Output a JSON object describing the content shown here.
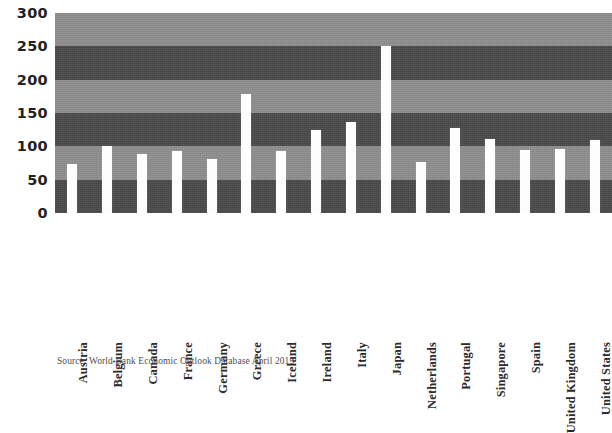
{
  "chart_data": {
    "type": "bar",
    "title": "",
    "subtitle": "",
    "xlabel": "",
    "ylabel": "",
    "ylim": [
      0,
      300
    ],
    "ytick_step": 50,
    "ytick_labels": [
      "300",
      "250",
      "200",
      "150",
      "100",
      "50",
      "0"
    ],
    "ytick_values": [
      300,
      250,
      200,
      150,
      100,
      50,
      0
    ],
    "grid": false,
    "banded_background": true,
    "band_colors": {
      "light": "#8f8f8f",
      "dark": "#4a4a4a"
    },
    "bar_color": "#fdfdfd",
    "legend": [],
    "legend_position": "none",
    "categories": [
      "Austria",
      "Belgium",
      "Canada",
      "France",
      "Germany",
      "Greece",
      "Iceland",
      "Ireland",
      "Italy",
      "Japan",
      "Netherlands",
      "Portugal",
      "Singapore",
      "Spain",
      "United Kingdom",
      "United States"
    ],
    "values": [
      74,
      101,
      88,
      93,
      81,
      179,
      93,
      125,
      136,
      250,
      77,
      128,
      111,
      95,
      96,
      109
    ],
    "annotations": [],
    "source": "Source: World Bank Economic Outlook Database April 2013"
  },
  "figure": {
    "source_note": "Source: World Bank Economic Outlook Database April 2013"
  }
}
